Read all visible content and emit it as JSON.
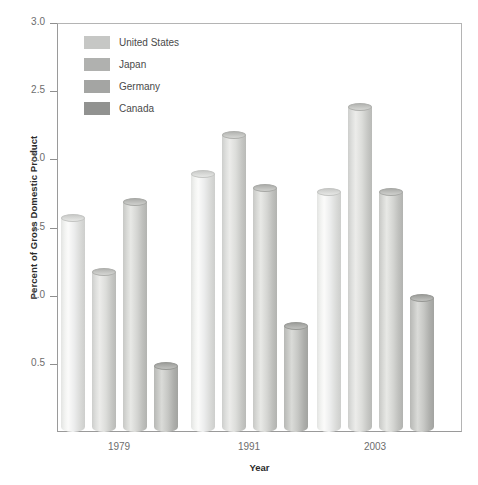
{
  "chart_data": {
    "type": "bar",
    "title": "",
    "subtitle": "",
    "xlabel": "Year",
    "ylabel": "Percent of Gross Domestic Product",
    "categories": [
      "1979",
      "1991",
      "2003"
    ],
    "series": [
      {
        "name": "United States",
        "values": [
          1.6,
          1.92,
          1.79
        ],
        "color": "#c6c7c5"
      },
      {
        "name": "Japan",
        "values": [
          1.2,
          2.21,
          2.41
        ],
        "color": "#b0b1af"
      },
      {
        "name": "Germany",
        "values": [
          1.72,
          1.82,
          1.79
        ],
        "color": "#a4a5a3"
      },
      {
        "name": "Canada",
        "values": [
          0.51,
          0.81,
          1.01
        ],
        "color": "#919290"
      }
    ],
    "ylim": [
      0.0,
      3.0
    ],
    "yticks": [
      "0.5",
      "1.0",
      "1.5",
      "2.0",
      "2.5",
      "3.0"
    ],
    "ytick_values": [
      0.5,
      1.0,
      1.5,
      2.0,
      2.5,
      3.0
    ],
    "xticks": [
      "1979",
      "1991",
      "2003"
    ],
    "grid": false,
    "legend_position": "top-left",
    "legend_entries": [
      "United States",
      "Japan",
      "Germany",
      "Canada"
    ],
    "annotations": []
  },
  "axis": {
    "y_title": "Percent of Gross Domestic Product",
    "x_title": "Year"
  }
}
